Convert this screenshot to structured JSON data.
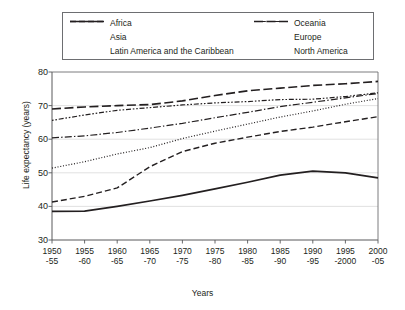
{
  "chart_data": {
    "type": "line",
    "title": "",
    "xlabel": "Years",
    "ylabel": "Life expectancy (years)",
    "ylim": [
      30,
      80
    ],
    "yticks": [
      30,
      40,
      50,
      60,
      70,
      80
    ],
    "grid": true,
    "legend_position": "top",
    "categories": [
      "1950-55",
      "1955-60",
      "1960-65",
      "1965-70",
      "1970-75",
      "1975-80",
      "1980-85",
      "1985-90",
      "1990-95",
      "1995-2000",
      "2000-05"
    ],
    "x_tick_labels": [
      {
        "top": "1950",
        "bottom": "-55"
      },
      {
        "top": "1955",
        "bottom": "-60"
      },
      {
        "top": "1960",
        "bottom": "-65"
      },
      {
        "top": "1965",
        "bottom": "-70"
      },
      {
        "top": "1970",
        "bottom": "-75"
      },
      {
        "top": "1975",
        "bottom": "-80"
      },
      {
        "top": "1980",
        "bottom": "-85"
      },
      {
        "top": "1985",
        "bottom": "-90"
      },
      {
        "top": "1990",
        "bottom": "-95"
      },
      {
        "top": "1995",
        "bottom": "-2000"
      },
      {
        "top": "2000",
        "bottom": "-05"
      }
    ],
    "series": [
      {
        "name": "Africa",
        "style": "solid",
        "values": [
          38.5,
          38.6,
          40.0,
          41.6,
          43.3,
          45.2,
          47.2,
          49.3,
          50.5,
          50.0,
          48.5
        ]
      },
      {
        "name": "Asia",
        "style": "dashed",
        "values": [
          41.3,
          43.0,
          45.5,
          51.8,
          56.3,
          58.8,
          60.6,
          62.3,
          63.6,
          65.2,
          66.7
        ]
      },
      {
        "name": "Latin America and the Caribbean",
        "style": "dotted",
        "values": [
          51.4,
          53.3,
          55.6,
          57.5,
          60.2,
          62.4,
          64.5,
          66.6,
          68.4,
          70.4,
          72.1
        ]
      },
      {
        "name": "Oceania",
        "style": "dashdot",
        "values": [
          60.4,
          61.0,
          62.0,
          63.3,
          64.7,
          66.4,
          68.0,
          69.7,
          71.0,
          72.3,
          73.6
        ]
      },
      {
        "name": "Europe",
        "style": "dashdotdot",
        "values": [
          65.6,
          67.2,
          68.6,
          69.4,
          70.2,
          70.8,
          71.2,
          71.8,
          71.9,
          72.7,
          73.8
        ]
      },
      {
        "name": "North America",
        "style": "longdash",
        "values": [
          69.0,
          69.6,
          70.0,
          70.3,
          71.4,
          73.0,
          74.4,
          75.2,
          76.0,
          76.5,
          77.2
        ]
      }
    ]
  },
  "legend": {
    "items": [
      {
        "label": "Africa",
        "style": "solid"
      },
      {
        "label": "Asia",
        "style": "dashed"
      },
      {
        "label": "Latin America and the Caribbean",
        "style": "dotted"
      },
      {
        "label": "Oceania",
        "style": "dashdot"
      },
      {
        "label": "Europe",
        "style": "dashdotdot"
      },
      {
        "label": "North America",
        "style": "longdash"
      }
    ]
  }
}
